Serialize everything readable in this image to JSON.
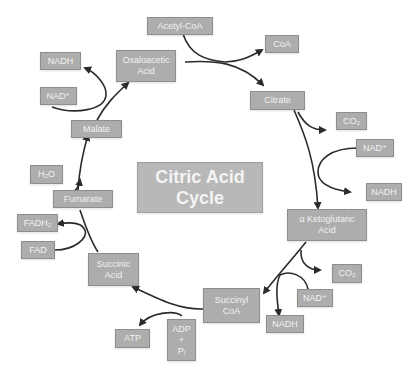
{
  "title": "Citric Acid\nCycle",
  "nodes": {
    "acetyl_coa": "Acetyl-CoA",
    "coa": "CoA",
    "oxaloacetic": "Oxaloacetic\nAcid",
    "citrate": "Citrate",
    "co2_1": "CO₂",
    "nad_1": "NAD⁺",
    "nadh_1": "NADH",
    "aketo": "α Ketoglutaric\nAcid",
    "co2_2": "CO₂",
    "nad_2": "NAD⁺",
    "nadh_2": "NADH",
    "succinyl": "Succinyl\nCoA",
    "adp": "ADP\n+\nPᵢ",
    "atp": "ATP",
    "succinic": "Succinic\nAcid",
    "fadh2": "FADH₂",
    "fad": "FAD",
    "fumarate": "Fumarate",
    "h2o": "H₂O",
    "malate": "Malate",
    "nad_3": "NAD⁺",
    "nadh_3": "NADH"
  },
  "colors": {
    "box_fill": "#adadad",
    "box_border": "#8e8e8e",
    "text": "#f2f2f2",
    "arrow": "#2b2b2b"
  }
}
